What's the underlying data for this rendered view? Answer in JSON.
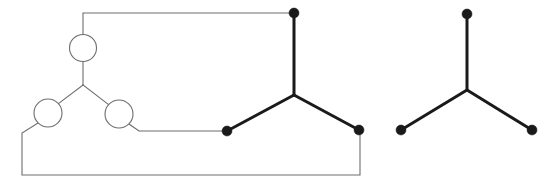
{
  "figure": {
    "background_color": "#ffffff",
    "width": 555,
    "height": 187,
    "colors": {
      "thin_line": "#6d6d6d",
      "thick_line": "#1a1a1a",
      "vertex_fill": "#1a1a1a",
      "circle_fill": "#ffffff"
    }
  },
  "left_figure": {
    "label": "left-graph-with-loops",
    "circles": [
      {
        "name": "top-circle",
        "cx": 83,
        "cy": 48,
        "r": 13.5
      },
      {
        "name": "lower-left-circle",
        "cx": 48,
        "cy": 113,
        "r": 14.0
      },
      {
        "name": "lower-right-circle",
        "cx": 119,
        "cy": 114,
        "r": 14.0
      }
    ],
    "junction": {
      "name": "left-y-junction",
      "x": 83,
      "y": 85
    },
    "thin_paths": [
      {
        "name": "top-circle-to-junction",
        "d": "M 83,61.5 L 83,85"
      },
      {
        "name": "junction-to-lower-left-circle",
        "d": "M 83,85 L 58.5,103.5"
      },
      {
        "name": "junction-to-lower-right-circle",
        "d": "M 83,85 L 108.5,104.5"
      },
      {
        "name": "top-circle-to-top-rail",
        "d": "M 83,34.5 L 83,13 L 294,13"
      },
      {
        "name": "lower-right-circle-to-bottom-left-dot",
        "d": "M 129,124 L 139,131 L 227,131"
      },
      {
        "name": "lower-left-circle-to-bottom-rail",
        "d": "M 38,123 L 22,133 L 22,175 L 360,175 L 360,131"
      }
    ]
  },
  "middle_figure": {
    "label": "middle-tripod-graph",
    "center": {
      "name": "middle-center-junction",
      "x": 294,
      "y": 95
    },
    "vertices": [
      {
        "name": "middle-top-vertex",
        "cx": 294,
        "cy": 13,
        "r": 5.0
      },
      {
        "name": "middle-bottom-left-vertex",
        "cx": 227,
        "cy": 131,
        "r": 5.0
      },
      {
        "name": "middle-bottom-right-vertex",
        "cx": 359,
        "cy": 130,
        "r": 5.0
      }
    ],
    "edges": [
      {
        "name": "middle-edge-top",
        "d": "M 294,95 L 294,13"
      },
      {
        "name": "middle-edge-bottom-left",
        "d": "M 294,95 L 227,131"
      },
      {
        "name": "middle-edge-bottom-right",
        "d": "M 294,95 L 359,130"
      }
    ]
  },
  "right_figure": {
    "label": "right-tripod-graph",
    "center": {
      "name": "right-center-junction",
      "x": 467,
      "y": 90
    },
    "vertices": [
      {
        "name": "right-top-vertex",
        "cx": 467,
        "cy": 14,
        "r": 5.0
      },
      {
        "name": "right-bottom-left-vertex",
        "cx": 401,
        "cy": 130,
        "r": 5.0
      },
      {
        "name": "right-bottom-right-vertex",
        "cx": 532,
        "cy": 130,
        "r": 5.0
      }
    ],
    "edges": [
      {
        "name": "right-edge-top",
        "d": "M 467,90 L 467,14"
      },
      {
        "name": "right-edge-bottom-left",
        "d": "M 467,90 L 401,130"
      },
      {
        "name": "right-edge-bottom-right",
        "d": "M 467,90 L 532,130"
      }
    ]
  }
}
